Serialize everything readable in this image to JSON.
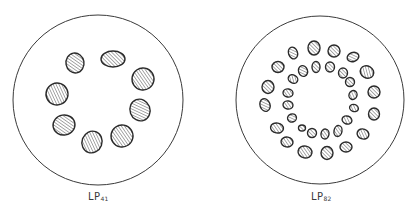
{
  "figure": {
    "stroke_color": "#3a3a3a",
    "fill_color": "#ffffff",
    "hatch_color": "#555555",
    "panels": [
      {
        "id": "lp41",
        "label_main": "LP",
        "label_sub": "41",
        "circle": {
          "cx": 98,
          "cy": 100,
          "r": 85
        },
        "label_pos": {
          "x": 88,
          "y": 191
        },
        "rings": [
          {
            "name": "single-ring",
            "blobs": [
              {
                "cx": 75,
                "cy": 63,
                "rx": 9,
                "ry": 10,
                "rot": -10
              },
              {
                "cx": 113,
                "cy": 59,
                "rx": 12,
                "ry": 8,
                "rot": 0
              },
              {
                "cx": 143,
                "cy": 79,
                "rx": 11,
                "ry": 11,
                "rot": 10
              },
              {
                "cx": 140,
                "cy": 110,
                "rx": 10,
                "ry": 11,
                "rot": -20
              },
              {
                "cx": 122,
                "cy": 136,
                "rx": 11,
                "ry": 11,
                "rot": 10
              },
              {
                "cx": 92,
                "cy": 142,
                "rx": 10,
                "ry": 11,
                "rot": 20
              },
              {
                "cx": 64,
                "cy": 125,
                "rx": 11,
                "ry": 10,
                "rot": -10
              },
              {
                "cx": 57,
                "cy": 94,
                "rx": 11,
                "ry": 11,
                "rot": 20
              }
            ]
          }
        ]
      },
      {
        "id": "lp82",
        "label_main": "LP",
        "label_sub": "82",
        "circle": {
          "cx": 320,
          "cy": 100,
          "r": 84
        },
        "label_pos": {
          "x": 311,
          "y": 191
        },
        "rings": [
          {
            "name": "outer-ring",
            "blobs": [
              {
                "cx": 293,
                "cy": 53,
                "rx": 4.5,
                "ry": 6,
                "rot": -20
              },
              {
                "cx": 314,
                "cy": 48,
                "rx": 6,
                "ry": 7,
                "rot": 0
              },
              {
                "cx": 334,
                "cy": 51,
                "rx": 6,
                "ry": 6,
                "rot": 0
              },
              {
                "cx": 353,
                "cy": 57,
                "rx": 6,
                "ry": 4.5,
                "rot": -20
              },
              {
                "cx": 367,
                "cy": 72,
                "rx": 7,
                "ry": 6,
                "rot": 30
              },
              {
                "cx": 374,
                "cy": 92,
                "rx": 6,
                "ry": 6,
                "rot": 0
              },
              {
                "cx": 374,
                "cy": 114,
                "rx": 5.5,
                "ry": 6,
                "rot": 0
              },
              {
                "cx": 363,
                "cy": 134,
                "rx": 6,
                "ry": 5,
                "rot": 20
              },
              {
                "cx": 346,
                "cy": 147,
                "rx": 6,
                "ry": 5,
                "rot": 0
              },
              {
                "cx": 327,
                "cy": 153,
                "rx": 6,
                "ry": 6.5,
                "rot": 0
              },
              {
                "cx": 305,
                "cy": 152,
                "rx": 7,
                "ry": 6,
                "rot": 10
              },
              {
                "cx": 287,
                "cy": 142,
                "rx": 6,
                "ry": 5,
                "rot": 10
              },
              {
                "cx": 277,
                "cy": 128,
                "rx": 6.5,
                "ry": 5,
                "rot": 10
              },
              {
                "cx": 265,
                "cy": 105,
                "rx": 5,
                "ry": 6.5,
                "rot": -20
              },
              {
                "cx": 268,
                "cy": 87,
                "rx": 6,
                "ry": 6.5,
                "rot": 0
              },
              {
                "cx": 278,
                "cy": 67,
                "rx": 6,
                "ry": 5.5,
                "rot": 0
              }
            ]
          },
          {
            "name": "inner-ring",
            "blobs": [
              {
                "cx": 293,
                "cy": 79,
                "rx": 5,
                "ry": 4,
                "rot": 30
              },
              {
                "cx": 303,
                "cy": 71,
                "rx": 4.5,
                "ry": 5.5,
                "rot": -20
              },
              {
                "cx": 316,
                "cy": 67,
                "rx": 4,
                "ry": 5.5,
                "rot": 0
              },
              {
                "cx": 330,
                "cy": 67,
                "rx": 4.5,
                "ry": 5,
                "rot": 0
              },
              {
                "cx": 343,
                "cy": 73,
                "rx": 4.5,
                "ry": 5,
                "rot": 0
              },
              {
                "cx": 350,
                "cy": 82,
                "rx": 4.5,
                "ry": 4.5,
                "rot": 0
              },
              {
                "cx": 353,
                "cy": 95,
                "rx": 4,
                "ry": 4.5,
                "rot": 20
              },
              {
                "cx": 354,
                "cy": 108,
                "rx": 4.5,
                "ry": 3.5,
                "rot": 20
              },
              {
                "cx": 347,
                "cy": 120,
                "rx": 5,
                "ry": 4,
                "rot": 20
              },
              {
                "cx": 338,
                "cy": 131,
                "rx": 4,
                "ry": 5.5,
                "rot": 10
              },
              {
                "cx": 325,
                "cy": 134,
                "rx": 4,
                "ry": 5,
                "rot": 10
              },
              {
                "cx": 312,
                "cy": 133,
                "rx": 4.5,
                "ry": 4.5,
                "rot": 0
              },
              {
                "cx": 302,
                "cy": 128,
                "rx": 3.5,
                "ry": 3,
                "rot": 0
              },
              {
                "cx": 292,
                "cy": 118,
                "rx": 4.5,
                "ry": 4,
                "rot": -20
              },
              {
                "cx": 288,
                "cy": 105,
                "rx": 5,
                "ry": 4,
                "rot": 10
              },
              {
                "cx": 288,
                "cy": 93,
                "rx": 5,
                "ry": 4,
                "rot": 10
              }
            ]
          }
        ]
      }
    ]
  }
}
